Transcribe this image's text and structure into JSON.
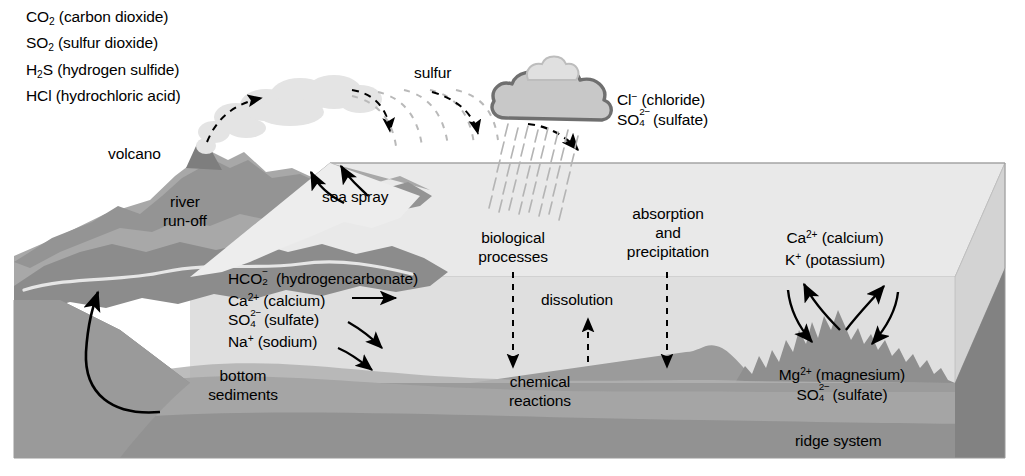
{
  "diagram": {
    "width": 1025,
    "height": 476
  },
  "colors": {
    "ink": "#000000",
    "background": "#ffffff",
    "ocean_top_face": "#e8e8e8",
    "ocean_water_face": "#dcdcdc",
    "ocean_right_face": "#d2d2d2",
    "seafloor_rock": "#999999",
    "seafloor_rock_dark": "#8a8a8a",
    "land_light": "#a9a9a9",
    "land_mid": "#949494",
    "land_dark": "#7f7f7f",
    "sediment": "#b4b4b4",
    "plume": "#e2e2e2",
    "cloud_fill": "#c6c6c6",
    "cloud_outline": "#6e6e6e",
    "rain": "#b0b0b0"
  },
  "atmosphere": {
    "volcanic_gases": [
      {
        "formula_pre": "CO",
        "sub": "2",
        "name": "(carbon dioxide)"
      },
      {
        "formula_pre": "SO",
        "sub": "2",
        "name": "(sulfur dioxide)"
      },
      {
        "formula_pre": "H",
        "sub": "2",
        "sub_post": "S",
        "name": "(hydrogen sulfide)"
      },
      {
        "formula_pre": "HCl",
        "sub": "",
        "name": "(hydrochloric acid)"
      }
    ],
    "gas_lines": [
      "CO2 (carbon dioxide)",
      "SO2 (sulfur dioxide)",
      "H2S (hydrogen sulfide)",
      "HCl (hydrochloric acid)"
    ],
    "sulfur_label": "sulfur",
    "rain_ions": [
      {
        "ion": "Cl",
        "charge": "−",
        "name": "(chloride)"
      },
      {
        "ion": "SO",
        "sub": "4",
        "charge": "2−",
        "name": "(sulfate)"
      }
    ]
  },
  "land": {
    "volcano_label": "volcano",
    "river_runoff_label_line1": "river",
    "river_runoff_label_line2": "run-off",
    "sea_spray_label": "sea spray"
  },
  "ocean_surface_processes": {
    "biological_line1": "biological",
    "biological_line2": "processes",
    "absorption_line1": "absorption",
    "absorption_line2": "and",
    "absorption_line3": "precipitation",
    "dissolution_label": "dissolution",
    "chemical_line1": "chemical",
    "chemical_line2": "reactions"
  },
  "river_input_ions": [
    {
      "ion": "HCO",
      "sub": "2",
      "charge": "−",
      "name": "(hydrogencarbonate)"
    },
    {
      "ion": "Ca",
      "charge": "2+",
      "name": "(calcium)"
    },
    {
      "ion": "SO",
      "sub": "4",
      "charge": "2−",
      "name": "(sulfate)"
    },
    {
      "ion": "Na",
      "charge": "+",
      "name": "(sodium)"
    }
  ],
  "seawater_ions_upper": [
    {
      "ion": "Ca",
      "charge": "2+",
      "name": "(calcium)"
    },
    {
      "ion": "K",
      "charge": "+",
      "name": "(potassium)"
    }
  ],
  "ridge_ions": [
    {
      "ion": "Mg",
      "charge": "2+",
      "name": "(magnesium)"
    },
    {
      "ion": "SO",
      "sub": "4",
      "charge": "2−",
      "name": "(sulfate)"
    }
  ],
  "seafloor": {
    "bottom_sediments_line1": "bottom",
    "bottom_sediments_line2": "sediments",
    "ridge_system_label": "ridge system"
  }
}
